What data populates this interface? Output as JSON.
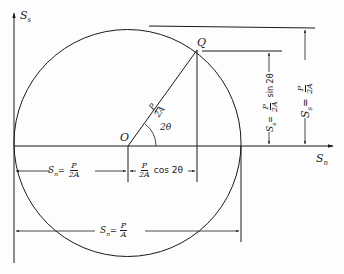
{
  "diagram": {
    "type": "mohr-circle",
    "axes": {
      "horizontal_label": "S",
      "horizontal_sub": "n",
      "vertical_label": "S",
      "vertical_sub": "s"
    },
    "points": {
      "center": "O",
      "circle_point": "Q"
    },
    "radius_label": {
      "num": "P",
      "den": "2A"
    },
    "angle_label": "2θ",
    "dimensions": {
      "center_offset": {
        "prefix": "S",
        "sub": "n",
        "eq": "=",
        "num": "P",
        "den": "2A"
      },
      "horizontal_projection": {
        "num": "P",
        "den": "2A",
        "suffix": "cos 2θ"
      },
      "diameter": {
        "prefix": "S",
        "sub": "n",
        "eq": "=",
        "num": "P",
        "den": "A"
      },
      "vertical_projection": {
        "prefix": "S",
        "sub": "s",
        "eq": "=",
        "num": "P",
        "den": "2A",
        "suffix": "sin 2θ"
      },
      "max_shear": {
        "prefix": "S",
        "sub": "s",
        "eq": "=",
        "num": "P",
        "den": "2A"
      }
    },
    "colors": {
      "ink": "#1a1a1a",
      "background": "#fdfdfd"
    }
  }
}
